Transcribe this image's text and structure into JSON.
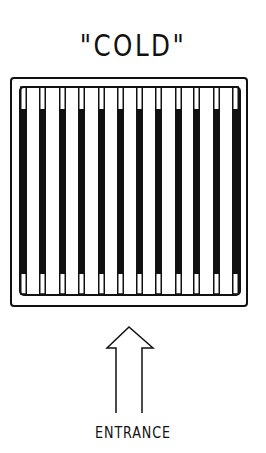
{
  "diagram": {
    "title": "\"COLD\"",
    "caption": "ENTRANCE",
    "colors": {
      "ink": "#111111",
      "background": "#ffffff"
    },
    "frame": {
      "outer": {
        "x": 11,
        "y": 78,
        "w": 236,
        "h": 228
      },
      "inner": {
        "x": 20,
        "y": 87,
        "w": 220,
        "h": 208
      }
    },
    "tubes": {
      "count": 12,
      "x_positions": [
        20,
        39,
        59,
        78,
        98,
        117,
        136,
        155,
        175,
        193,
        213,
        232
      ],
      "width": 7,
      "open_top": 87,
      "fill_top": 109,
      "fill_bottom": 274,
      "open_bottom": 294
    },
    "arrow": {
      "direction": "up",
      "tip": [
        129,
        327
      ],
      "head_base_y": 348,
      "head_left_x": 107,
      "head_right_x": 153,
      "shaft_left_x": 116,
      "shaft_right_x": 142,
      "shaft_bottom_y": 413
    }
  }
}
